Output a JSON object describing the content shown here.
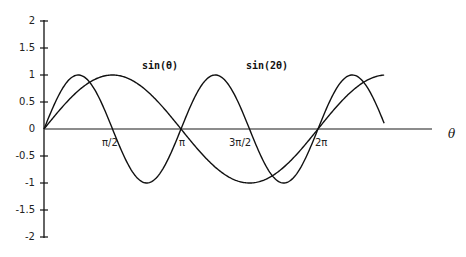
{
  "chart_data": {
    "type": "line",
    "title": "",
    "xlabel": "θ",
    "ylabel": "",
    "xlim": [
      0,
      7.8
    ],
    "ylim": [
      -2,
      2
    ],
    "grid": false,
    "legend_position": "inline labels above curves",
    "y_ticks": [
      "2",
      "1.5",
      "1",
      "0.5",
      "0",
      "-0.5",
      "-1",
      "-1.5",
      "-2"
    ],
    "x_ticks": [
      {
        "label": "π/2",
        "value": 1.5708
      },
      {
        "label": "π",
        "value": 3.1416
      },
      {
        "label": "3π/2",
        "value": 4.7124
      },
      {
        "label": "2π",
        "value": 6.2832
      }
    ],
    "series": [
      {
        "name": "sin(θ)",
        "label": "sin(θ)",
        "function": "sin(theta)",
        "x_range": [
          0,
          7.8
        ],
        "x": [
          0,
          0.7854,
          1.5708,
          2.3562,
          3.1416,
          3.927,
          4.7124,
          5.4978,
          6.2832,
          7.0686,
          7.8
        ],
        "values": [
          0,
          0.707,
          1,
          0.707,
          0,
          -0.707,
          -1,
          -0.707,
          0,
          0.707,
          0.998
        ]
      },
      {
        "name": "sin(2θ)",
        "label": "sin(2θ)",
        "function": "sin(2*theta)",
        "x_range": [
          0,
          7.8
        ],
        "x": [
          0,
          0.7854,
          1.5708,
          2.3562,
          3.1416,
          3.927,
          4.7124,
          5.4978,
          6.2832,
          7.0686,
          7.8
        ],
        "values": [
          0,
          1,
          0,
          -1,
          0,
          1,
          0,
          -1,
          0,
          1,
          0.125
        ]
      }
    ],
    "annotations": [
      {
        "text": "sin(θ)",
        "near": "x≈π/2 peak"
      },
      {
        "text": "sin(2θ)",
        "near": "x≈5π/4 peak"
      }
    ]
  },
  "labels": {
    "x_axis_title": "θ",
    "series_label_1": "sin(θ)",
    "series_label_2": "sin(2θ)",
    "y_ticks": [
      "2",
      "1.5",
      "1",
      "0.5",
      "0",
      "-0.5",
      "-1",
      "-1.5",
      "-2"
    ],
    "x_ticks": [
      "π/2",
      "π",
      "3π/2",
      "2π"
    ]
  }
}
